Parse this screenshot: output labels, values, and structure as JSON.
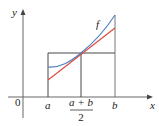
{
  "axes": {
    "x_label": "x",
    "y_label": "y",
    "origin_label": "0"
  },
  "ticks": {
    "a": "a",
    "mid_numerator": "a + b",
    "mid_denominator": "2",
    "b": "b"
  },
  "curve": {
    "label": "f",
    "color": "#4a7fc1"
  },
  "tangent": {
    "color": "#e0453a"
  },
  "colors": {
    "axis": "#555555",
    "rect": "#333333"
  }
}
